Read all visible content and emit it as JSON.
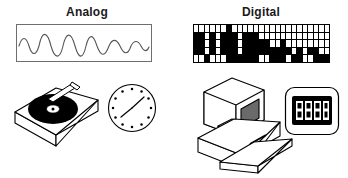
{
  "figure": {
    "title_left": "Analog",
    "title_right": "Digital",
    "line_color": "#6e6e6e",
    "ink_color": "#000000",
    "background": "#ffffff"
  },
  "analog": {
    "heading": "Analog",
    "waveform": {
      "description": "continuous smooth sine wave with varying amplitude",
      "amplitudes": [
        0.55,
        0.95,
        0.9,
        0.95,
        0.6,
        0.4,
        0.35
      ],
      "cycles": 6
    },
    "objects": [
      {
        "name": "turntable",
        "label": "record player with vinyl disc and tonearm"
      },
      {
        "name": "analog-clock",
        "label": "clock face with 12 dot markers and two hands"
      }
    ],
    "clock": {
      "markers": 12,
      "hour_hand_deg": 35,
      "minute_hand_deg": 218
    }
  },
  "digital": {
    "heading": "Digital",
    "bitmap": {
      "description": "black and white pixel grid representing discrete samples",
      "columns": 25,
      "rows": 5,
      "on_color": "#000000",
      "off_color": "#ffffff",
      "pixels": [
        [
          0,
          0,
          0,
          0,
          0,
          0,
          1,
          0,
          0,
          0,
          0,
          0,
          0,
          0,
          0,
          0,
          0,
          0,
          0,
          0,
          0,
          0,
          0,
          0,
          0
        ],
        [
          1,
          1,
          0,
          1,
          0,
          1,
          1,
          1,
          0,
          1,
          1,
          1,
          0,
          0,
          0,
          0,
          0,
          0,
          0,
          0,
          0,
          0,
          0,
          0,
          0
        ],
        [
          1,
          1,
          0,
          1,
          0,
          1,
          1,
          1,
          0,
          1,
          1,
          1,
          1,
          1,
          0,
          0,
          1,
          0,
          0,
          0,
          0,
          0,
          0,
          0,
          0
        ],
        [
          1,
          1,
          0,
          1,
          0,
          1,
          1,
          1,
          0,
          1,
          1,
          1,
          1,
          1,
          1,
          1,
          1,
          1,
          0,
          1,
          0,
          1,
          1,
          0,
          0
        ],
        [
          0,
          0,
          1,
          0,
          0,
          0,
          1,
          1,
          1,
          1,
          1,
          1,
          0,
          0,
          1,
          1,
          1,
          0,
          1,
          1,
          0,
          0,
          1,
          1,
          1
        ]
      ]
    },
    "objects": [
      {
        "name": "desktop-computer",
        "label": "CRT monitor, tower base and keyboard"
      },
      {
        "name": "digital-clock",
        "label": "LCD digital clock display"
      }
    ],
    "clock": {
      "display": "8:08",
      "segment_style": "seven-segment",
      "bezel_color": "#000000"
    }
  }
}
